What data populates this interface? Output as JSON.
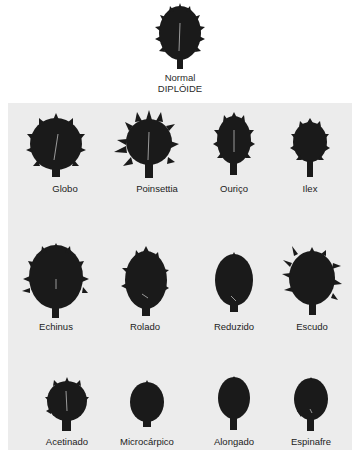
{
  "figure": {
    "normal": {
      "label_line1": "Normal",
      "label_line2": "DIPLÓIDE"
    },
    "panel_background": "#ececec",
    "fruit_color": "#1a1a1a",
    "mutants": [
      {
        "name": "Globo",
        "row": 1,
        "col": 1
      },
      {
        "name": "Poinsettia",
        "row": 1,
        "col": 2
      },
      {
        "name": "Ouriço",
        "row": 1,
        "col": 3
      },
      {
        "name": "Ilex",
        "row": 1,
        "col": 4
      },
      {
        "name": "Echinus",
        "row": 2,
        "col": 1
      },
      {
        "name": "Rolado",
        "row": 2,
        "col": 2
      },
      {
        "name": "Reduzido",
        "row": 2,
        "col": 3
      },
      {
        "name": "Escudo",
        "row": 2,
        "col": 4
      },
      {
        "name": "Acetinado",
        "row": 3,
        "col": 1
      },
      {
        "name": "Microcárpico",
        "row": 3,
        "col": 2
      },
      {
        "name": "Alongado",
        "row": 3,
        "col": 3
      },
      {
        "name": "Espinafre",
        "row": 3,
        "col": 4
      }
    ]
  }
}
